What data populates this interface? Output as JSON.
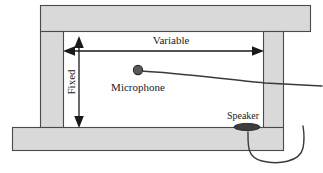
{
  "figure": {
    "background_color": "#ffffff",
    "wall_fill_color": "#d9d9d9",
    "wall_stroke_color": "#4a4a4a",
    "line_color": "#1a1a1a"
  },
  "labels": {
    "variable": "Variable",
    "fixed": "Fixed",
    "microphone": "Microphone",
    "speaker": "Speaker"
  },
  "dimensions": {
    "variable": {
      "name": "Variable",
      "orientation": "horizontal",
      "arrow_style": "double-headed"
    },
    "fixed": {
      "name": "Fixed",
      "orientation": "vertical",
      "arrow_style": "double-headed",
      "text_rotation": "-90"
    }
  },
  "components": [
    {
      "name": "microphone",
      "label": "Microphone",
      "shape": "filled-circle"
    },
    {
      "name": "speaker",
      "label": "Speaker",
      "shape": "filled-ellipse"
    }
  ],
  "structure": {
    "walls": [
      {
        "name": "top-wall",
        "orientation": "horizontal"
      },
      {
        "name": "left-wall",
        "orientation": "vertical"
      },
      {
        "name": "right-wall",
        "orientation": "vertical"
      },
      {
        "name": "bottom-wall",
        "orientation": "horizontal"
      }
    ]
  }
}
